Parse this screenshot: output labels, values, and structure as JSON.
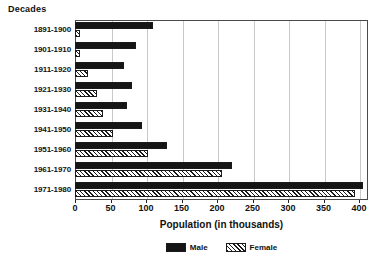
{
  "chart_data": {
    "type": "bar",
    "orientation": "horizontal",
    "title": "",
    "xlabel": "Population (in thousands)",
    "ylabel": "Decades",
    "categories": [
      "1891-1900",
      "1901-1910",
      "1911-1920",
      "1921-1930",
      "1931-1940",
      "1941-1950",
      "1951-1960",
      "1961-1970",
      "1971-1980"
    ],
    "series": [
      {
        "name": "Male",
        "values": [
          110,
          86,
          69,
          80,
          73,
          94,
          130,
          221,
          405
        ]
      },
      {
        "name": "Female",
        "values": [
          7,
          7,
          18,
          31,
          40,
          54,
          103,
          207,
          394
        ]
      }
    ],
    "xlim": [
      0,
      400
    ],
    "xticks": [
      0,
      50,
      100,
      150,
      200,
      250,
      300,
      350,
      400
    ],
    "xtick_labels": [
      "0",
      "50",
      "100",
      "150",
      "200",
      "250",
      "300",
      "350",
      "400"
    ],
    "grid": true,
    "grid_axis": "x",
    "legend_position": "bottom-center",
    "legend": [
      {
        "label": "Male",
        "pattern": "solid",
        "color": "#151515"
      },
      {
        "label": "Female",
        "pattern": "diagonal-hatch",
        "color": "#1a1a1a"
      }
    ]
  }
}
